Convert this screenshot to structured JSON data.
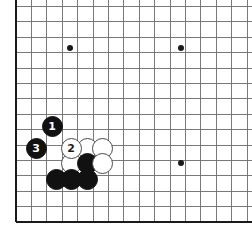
{
  "figure": {
    "board": {
      "type": "go-board",
      "board_size": 19,
      "visible_region": "bottom-left corner, partial board",
      "line_color": "#6b6b6b",
      "border_color": "#1a1a1a",
      "background_color": "#ffffff",
      "left_border_x": 16,
      "bottom_border_y": 222,
      "grid_pitch": 15.4,
      "columns_x": [
        16,
        31.4,
        46.8,
        62.2,
        70,
        77.6,
        93,
        108.4,
        123.8,
        139.2,
        154.6,
        170,
        181,
        185.4,
        200.8,
        216.2,
        231.6,
        247
      ],
      "rows_y": [
        10,
        25.4,
        40.8,
        48,
        56.2,
        71.6,
        87,
        102.4,
        117.8,
        133.2,
        148.6,
        163,
        164,
        179.4,
        194.8,
        210.2,
        222
      ]
    },
    "star_points": [
      {
        "name": "star-point-upper-left",
        "x": 70,
        "y": 48
      },
      {
        "name": "star-point-upper-right",
        "x": 181,
        "y": 48
      },
      {
        "name": "star-point-lower-right",
        "x": 181,
        "y": 163
      }
    ],
    "stones": [
      {
        "id": "stone-move-1",
        "color": "black",
        "label": "1",
        "x": 52,
        "y": 126,
        "r": 10.5
      },
      {
        "id": "stone-move-3",
        "color": "black",
        "label": "3",
        "x": 36,
        "y": 148,
        "r": 10.5
      },
      {
        "id": "stone-move-2",
        "color": "white",
        "label": "2",
        "x": 71,
        "y": 148,
        "r": 10.5
      },
      {
        "id": "stone-white-a",
        "color": "white",
        "label": "",
        "x": 87,
        "y": 148,
        "r": 10.5
      },
      {
        "id": "stone-white-b",
        "color": "white",
        "label": "",
        "x": 102,
        "y": 148,
        "r": 10.5
      },
      {
        "id": "stone-white-c",
        "color": "white",
        "label": "",
        "x": 71,
        "y": 163,
        "r": 10.5
      },
      {
        "id": "stone-black-d",
        "color": "black",
        "label": "",
        "x": 87,
        "y": 163,
        "r": 10.5
      },
      {
        "id": "stone-white-e",
        "color": "white",
        "label": "",
        "x": 102,
        "y": 163,
        "r": 10.5
      },
      {
        "id": "stone-black-f",
        "color": "black",
        "label": "",
        "x": 56,
        "y": 179,
        "r": 10.5
      },
      {
        "id": "stone-black-g",
        "color": "black",
        "label": "",
        "x": 71,
        "y": 179,
        "r": 10.5
      },
      {
        "id": "stone-black-h",
        "color": "black",
        "label": "",
        "x": 87,
        "y": 179,
        "r": 10.5
      }
    ],
    "move_sequence": [
      {
        "move": "1",
        "color": "black"
      },
      {
        "move": "2",
        "color": "white"
      },
      {
        "move": "3",
        "color": "black"
      }
    ]
  }
}
